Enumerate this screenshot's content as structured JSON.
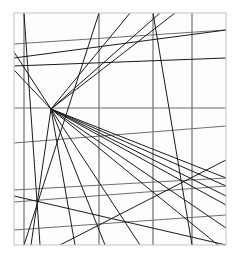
{
  "figure": {
    "canvas": {
      "width": 239,
      "height": 260
    },
    "background_color": "#fdfdfd",
    "page_color": "#ffffff",
    "frame": {
      "name": "picture-frame",
      "x1": 14,
      "y1": 13,
      "x2": 226,
      "y2": 245,
      "color": "#c8c8c8",
      "stroke_width": 1.1
    },
    "vanishing_point": {
      "x": 51,
      "y": 109,
      "label": "vanishing-point"
    },
    "stroke": {
      "line_color": "#1b1b1b",
      "grid_color": "#6e6e6e",
      "light_grid_color": "#9a9a9a",
      "line_width": 1.0,
      "grid_width": 1.2
    }
  },
  "chart_data": {
    "type": "line",
    "xlabel": "",
    "ylabel": "",
    "xlim": [
      14,
      226
    ],
    "ylim": [
      13,
      245
    ],
    "grid": true,
    "legend": "none",
    "vanishing_point": [
      51,
      109
    ],
    "series": [
      {
        "name": "vertical-gridlines",
        "kind": "vertical",
        "color": "#6e6e6e",
        "segments": [
          [
            24,
            13,
            24,
            245
          ],
          [
            99,
            13,
            99,
            245
          ],
          [
            153,
            13,
            153,
            245
          ],
          [
            192,
            13,
            192,
            245
          ]
        ]
      },
      {
        "name": "horizontal-gridlines",
        "kind": "horizontal",
        "color": "#6e6e6e",
        "segments": [
          [
            14,
            44,
            226,
            30
          ],
          [
            14,
            108,
            226,
            108
          ],
          [
            14,
            143,
            226,
            126
          ],
          [
            14,
            190,
            226,
            178
          ],
          [
            14,
            202,
            226,
            186
          ],
          [
            14,
            230,
            226,
            215
          ]
        ]
      },
      {
        "name": "converging-rays-up",
        "kind": "ray",
        "color": "#1b1b1b",
        "segments": [
          [
            51,
            109,
            130,
            13
          ],
          [
            51,
            109,
            160,
            13
          ],
          [
            51,
            109,
            175,
            13
          ],
          [
            51,
            109,
            14,
            52
          ],
          [
            51,
            109,
            14,
            70
          ]
        ]
      },
      {
        "name": "converging-rays-down",
        "kind": "ray",
        "color": "#1b1b1b",
        "segments": [
          [
            51,
            109,
            31,
            245
          ],
          [
            51,
            109,
            75,
            245
          ],
          [
            51,
            109,
            105,
            245
          ],
          [
            51,
            109,
            140,
            245
          ],
          [
            51,
            109,
            218,
            245
          ],
          [
            51,
            109,
            226,
            228
          ],
          [
            51,
            109,
            226,
            205
          ],
          [
            51,
            109,
            226,
            196
          ],
          [
            51,
            109,
            226,
            186
          ],
          [
            51,
            109,
            226,
            178
          ]
        ]
      },
      {
        "name": "oblique-lines",
        "kind": "oblique",
        "color": "#1b1b1b",
        "segments": [
          [
            14,
            58,
            226,
            30
          ],
          [
            14,
            66,
            226,
            58
          ],
          [
            24,
            13,
            40,
            245
          ],
          [
            99,
            13,
            24,
            245
          ],
          [
            153,
            13,
            192,
            245
          ],
          [
            14,
            196,
            226,
            245
          ],
          [
            60,
            245,
            226,
            160
          ]
        ]
      }
    ]
  }
}
